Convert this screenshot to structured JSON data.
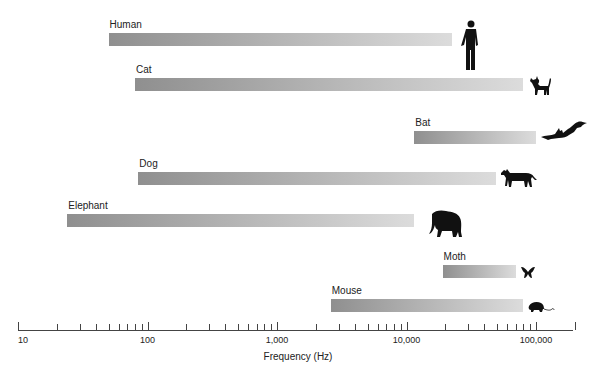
{
  "chart_data": {
    "type": "bar",
    "orientation": "horizontal-range",
    "title": "",
    "xlabel": "Frequency (Hz)",
    "ylabel": "",
    "xscale": "log",
    "xlim": [
      10,
      200000
    ],
    "x_tick_labels": [
      "10",
      "100",
      "1,000",
      "10,000",
      "100,000"
    ],
    "x_tick_values": [
      10,
      100,
      1000,
      10000,
      100000
    ],
    "grid": false,
    "legend": null,
    "categories": [
      "Human",
      "Cat",
      "Bat",
      "Dog",
      "Elephant",
      "Moth",
      "Mouse"
    ],
    "series": [
      {
        "name": "Hearing range low (Hz)",
        "values": [
          50,
          80,
          11500,
          85,
          24,
          19000,
          2600
        ]
      },
      {
        "name": "Hearing range high (Hz)",
        "values": [
          22500,
          80000,
          100000,
          49000,
          11500,
          70000,
          80000
        ]
      }
    ],
    "bars": [
      {
        "label": "Human",
        "low": 50,
        "high": 22500,
        "icon": "human-icon"
      },
      {
        "label": "Cat",
        "low": 80,
        "high": 80000,
        "icon": "cat-icon"
      },
      {
        "label": "Bat",
        "low": 11500,
        "high": 100000,
        "icon": "bat-icon"
      },
      {
        "label": "Dog",
        "low": 85,
        "high": 49000,
        "icon": "dog-icon"
      },
      {
        "label": "Elephant",
        "low": 24,
        "high": 11500,
        "icon": "elephant-icon"
      },
      {
        "label": "Moth",
        "low": 19000,
        "high": 70000,
        "icon": "moth-icon"
      },
      {
        "label": "Mouse",
        "low": 2600,
        "high": 80000,
        "icon": "mouse-icon"
      }
    ]
  },
  "style": {
    "bar_gradient_start": "#8f8f8f",
    "bar_gradient_end": "#dcdcdc",
    "icon_color": "#111111",
    "axis_color": "#444444"
  }
}
